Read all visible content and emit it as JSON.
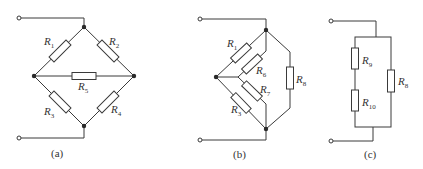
{
  "figures": [
    {
      "caption": "(a)",
      "resistors": [
        {
          "name": "R",
          "sub": "1"
        },
        {
          "name": "R",
          "sub": "2"
        },
        {
          "name": "R",
          "sub": "5"
        },
        {
          "name": "R",
          "sub": "3"
        },
        {
          "name": "R",
          "sub": "4"
        }
      ]
    },
    {
      "caption": "(b)",
      "resistors": [
        {
          "name": "R",
          "sub": "1"
        },
        {
          "name": "R",
          "sub": "6"
        },
        {
          "name": "R",
          "sub": "7"
        },
        {
          "name": "R",
          "sub": "3"
        },
        {
          "name": "R",
          "sub": "8"
        }
      ]
    },
    {
      "caption": "(c)",
      "resistors": [
        {
          "name": "R",
          "sub": "9"
        },
        {
          "name": "R",
          "sub": "10"
        },
        {
          "name": "R",
          "sub": "8"
        }
      ]
    }
  ],
  "colors": {
    "line": "#3a3a3a",
    "background": "#ffffff"
  }
}
